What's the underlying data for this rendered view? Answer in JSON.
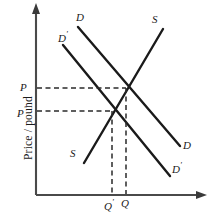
{
  "figure": {
    "type": "supply-demand-diagram",
    "axes": {
      "y_label": "Price / pound",
      "x_label": "",
      "origin": [
        36,
        195
      ],
      "y_top": [
        36,
        6
      ],
      "x_right": [
        205,
        195
      ]
    },
    "price_ticks": [
      {
        "name": "P",
        "label": "P",
        "prime": "",
        "y": 88
      },
      {
        "name": "P-prime",
        "label": "P",
        "prime": "′",
        "y": 111
      }
    ],
    "quantity_ticks": [
      {
        "name": "Q-prime",
        "label": "Q",
        "prime": "′",
        "x": 112
      },
      {
        "name": "Q",
        "label": "Q",
        "prime": "",
        "x": 126
      }
    ],
    "curves": [
      {
        "name": "demand-original",
        "label": "D",
        "prime": "",
        "x1": 78,
        "y1": 27,
        "x2": 180,
        "y2": 146,
        "label_start": {
          "x": 76,
          "y": 12
        },
        "label_end": {
          "x": 183,
          "y": 140
        }
      },
      {
        "name": "demand-shifted",
        "label": "D",
        "prime": "′",
        "x1": 63,
        "y1": 45,
        "x2": 170,
        "y2": 176,
        "label_start": {
          "x": 58,
          "y": 30
        },
        "label_end": {
          "x": 172,
          "y": 161
        }
      },
      {
        "name": "supply",
        "label": "S",
        "prime": "",
        "x1": 84,
        "y1": 163,
        "x2": 163,
        "y2": 29,
        "label_start": {
          "x": 70,
          "y": 148
        },
        "label_end": {
          "x": 152,
          "y": 14
        }
      }
    ],
    "equilibria": [
      {
        "name": "equilibrium-original",
        "x": 126,
        "y": 88
      },
      {
        "name": "equilibrium-shifted",
        "x": 112,
        "y": 111
      }
    ],
    "colors": {
      "ink": "#1a1a1a",
      "axis": "#4a4a4a",
      "dashed": "#2a2a2a",
      "background": "#ffffff"
    }
  }
}
